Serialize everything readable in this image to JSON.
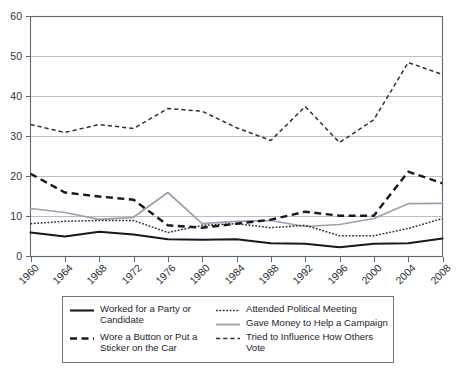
{
  "chart_data": {
    "type": "line",
    "title": "",
    "xlabel": "",
    "ylabel": "",
    "categories": [
      "1960",
      "1964",
      "1968",
      "1972",
      "1976",
      "1980",
      "1984",
      "1988",
      "1992",
      "1996",
      "2000",
      "2004",
      "2008"
    ],
    "x": [
      1960,
      1964,
      1968,
      1972,
      1976,
      1980,
      1984,
      1988,
      1992,
      1996,
      2000,
      2004,
      2008
    ],
    "ylim": [
      0,
      60
    ],
    "xlim": [
      1960,
      2008
    ],
    "yticks": [
      0,
      10,
      20,
      30,
      40,
      50,
      60
    ],
    "ytick_labels": [
      "0",
      "10",
      "20",
      "30",
      "40",
      "50",
      "60"
    ],
    "grid": true,
    "legend_position": "below",
    "series": [
      {
        "name": "Worked for a Party or Candidate",
        "style": "solid",
        "color": "#141a22",
        "values": [
          6.0,
          5.0,
          6.2,
          5.5,
          4.3,
          4.2,
          4.3,
          3.3,
          3.2,
          2.3,
          3.2,
          3.3,
          4.5
        ]
      },
      {
        "name": "Wore a Button or Put a Sticker on the Car",
        "style": "dashed",
        "color": "#141a22",
        "values": [
          20.7,
          16.0,
          15.0,
          14.2,
          7.8,
          7.2,
          8.2,
          9.2,
          11.2,
          10.2,
          10.2,
          21.2,
          18.3
        ]
      },
      {
        "name": "Attended Political Meeting",
        "style": "dotted",
        "color": "#2b323c",
        "values": [
          8.2,
          8.8,
          9.0,
          9.0,
          6.0,
          7.8,
          8.2,
          7.2,
          7.8,
          5.2,
          5.2,
          7.0,
          9.5
        ]
      },
      {
        "name": "Gave Money to Help a Campaign",
        "style": "solid",
        "color": "#98a1ad",
        "values": [
          12.0,
          11.0,
          9.3,
          9.8,
          16.0,
          8.2,
          8.8,
          9.0,
          7.5,
          8.0,
          9.5,
          13.2,
          13.3
        ]
      },
      {
        "name": "Tried to Influence How Others Vote",
        "style": "dashed-fine",
        "color": "#2b323c",
        "values": [
          33.0,
          31.0,
          33.0,
          32.0,
          37.0,
          36.3,
          32.2,
          29.0,
          37.5,
          28.5,
          34.2,
          48.5,
          45.5
        ]
      }
    ]
  },
  "axis": {
    "y_tick_labels": [
      "60",
      "50",
      "40",
      "30",
      "20",
      "10",
      "0"
    ],
    "x_tick_labels": [
      "1960",
      "1964",
      "1968",
      "1972",
      "1976",
      "1980",
      "1984",
      "1988",
      "1992",
      "1996",
      "2000",
      "2004",
      "2008"
    ]
  },
  "legend": {
    "items": [
      {
        "id": "worked",
        "label": "Worked for a Party or Candidate",
        "style": "solid",
        "color": "#141a22"
      },
      {
        "id": "button",
        "label": "Wore a Button or Put a Sticker on the Car",
        "style": "dashed",
        "color": "#141a22"
      },
      {
        "id": "meeting",
        "label": "Attended Political Meeting",
        "style": "dotted",
        "color": "#2b323c"
      },
      {
        "id": "money",
        "label": "Gave Money to Help a Campaign",
        "style": "solid",
        "color": "#98a1ad"
      },
      {
        "id": "influence",
        "label": "Tried to Influence How Others Vote",
        "style": "dashed-fine",
        "color": "#2b323c"
      }
    ]
  },
  "colors": {
    "background": "#ffffff",
    "axis": "#5d6775",
    "grid": "#9aa3b0",
    "dark_series": "#141a22",
    "gray_series": "#98a1ad",
    "text": "#1d2430"
  }
}
